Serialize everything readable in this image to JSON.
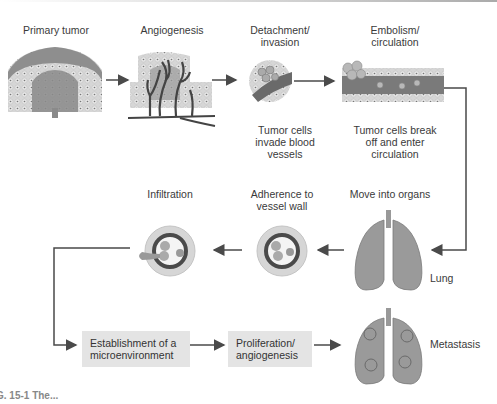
{
  "figure": {
    "steps_top": [
      {
        "id": "primary-tumor",
        "label": "Primary tumor"
      },
      {
        "id": "angiogenesis",
        "label": "Angiogenesis"
      },
      {
        "id": "detachment",
        "label_line1": "Detachment/",
        "label_line2": "invasion",
        "caption": [
          "Tumor cells",
          "invade blood",
          "vessels"
        ]
      },
      {
        "id": "embolism",
        "label_line1": "Embolism/",
        "label_line2": "circulation",
        "caption": [
          "Tumor cells break",
          "off and enter",
          "circulation"
        ]
      }
    ],
    "steps_middle": [
      {
        "id": "infiltration",
        "label": "Infiltration"
      },
      {
        "id": "adherence",
        "label_line1": "Adherence to",
        "label_line2": "vessel wall"
      },
      {
        "id": "move-into-organs",
        "label": "Move into organs",
        "organ_label": "Lung"
      }
    ],
    "steps_bottom": [
      {
        "id": "microenvironment",
        "label_line1": "Establishment of a",
        "label_line2": "microenvironment"
      },
      {
        "id": "proliferation",
        "label_line1": "Proliferation/",
        "label_line2": "angiogenesis"
      },
      {
        "id": "metastasis",
        "label": "Metastasis"
      }
    ],
    "caption_fragment": "G. 15-1  The..."
  },
  "colors": {
    "tissue": "#cfcfcf",
    "tumor": "#8a8a8a",
    "vessel": "#555555",
    "arrow": "#4a4a4a",
    "box": "#e4e4e4",
    "lung": "#9a9a9a"
  }
}
